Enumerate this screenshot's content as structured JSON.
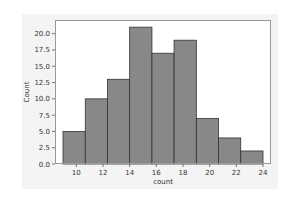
{
  "chart_data": {
    "type": "bar",
    "subtype": "histogram",
    "title": "",
    "xlabel": "count",
    "ylabel": "Count",
    "bin_edges": [
      9,
      10.67,
      12.33,
      14,
      15.67,
      17.33,
      19,
      20.67,
      22.33,
      24
    ],
    "values": [
      5,
      10,
      13,
      21,
      17,
      19,
      7,
      4,
      2
    ],
    "xlim": [
      8.4,
      24.6
    ],
    "ylim": [
      0,
      22.1
    ],
    "xticks": [
      10,
      12,
      14,
      16,
      18,
      20,
      22,
      24
    ],
    "xtick_labels": [
      "10",
      "12",
      "14",
      "16",
      "18",
      "20",
      "22",
      "24"
    ],
    "yticks": [
      0,
      2.5,
      5,
      7.5,
      10,
      12.5,
      15,
      17.5,
      20
    ],
    "ytick_labels": [
      "0.0",
      "2.5",
      "5.0",
      "7.5",
      "10.0",
      "12.5",
      "15.0",
      "17.5",
      "20.0"
    ],
    "grid": false,
    "legend": null,
    "colors": {
      "bar_fill": "#888888",
      "bar_edge": "#333333",
      "figure_bg": "#f4f4f4",
      "axes_bg": "#ffffff",
      "frame": "#999999"
    }
  }
}
